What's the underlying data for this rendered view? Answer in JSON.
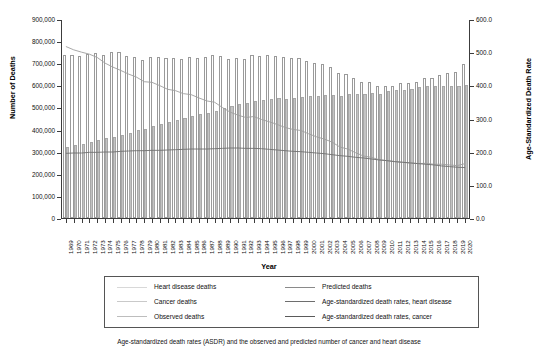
{
  "figure": {
    "caption": "Age-standardized death rates (ASDR) and the observed and predicted number of cancer and heart disease"
  },
  "axes": {
    "y_left": {
      "title": "Number of Deaths",
      "ticks": [
        "0",
        "100,000",
        "200,000",
        "300,000",
        "400,000",
        "500,000",
        "600,000",
        "700,000",
        "800,000",
        "900,000"
      ],
      "min": 0,
      "max": 900000
    },
    "y_right": {
      "title": "Age-Standardized Death Rate",
      "ticks": [
        "0.0",
        "100.0",
        "200.0",
        "300.0",
        "400.0",
        "500.0",
        "600.0"
      ],
      "min": 0,
      "max": 600
    },
    "x": {
      "title": "Year"
    }
  },
  "legend": {
    "items": [
      {
        "label": "Heart disease deaths",
        "swatch": "bar-outline-light",
        "color": "#d8d8d8"
      },
      {
        "label": "Cancer deaths",
        "swatch": "bar-fill-gray",
        "color": "#c9c9c9"
      },
      {
        "label": "Observed deaths",
        "swatch": "line-light-gray",
        "color": "#bdbdbd"
      },
      {
        "label": "Predicted deaths",
        "swatch": "line-mid-gray",
        "color": "#8a8a8a"
      },
      {
        "label": "Age-standardized death rates, heart disease",
        "swatch": "line-dark-gray",
        "color": "#6e6e6e"
      },
      {
        "label": "Age-standardized death rates, cancer",
        "swatch": "line-darkest-gray",
        "color": "#5a5a5a"
      }
    ]
  },
  "colors": {
    "heart_bar_fill": "#ffffff",
    "heart_bar_edge": "#9a9a9a",
    "cancer_bar_fill": "#c3c3c3",
    "cancer_bar_edge": "#a8a8a8",
    "asdr_heart_line": "#9e9e9e",
    "asdr_cancer_line": "#707070",
    "axis": "#3c3c3c"
  },
  "chart_data": {
    "type": "bar",
    "title": "",
    "subtitle": "",
    "xlabel": "Year",
    "ylabel": "Number of Deaths",
    "y2label": "Age-Standardized Death Rate",
    "ylim": [
      0,
      900000
    ],
    "y2lim": [
      0,
      600
    ],
    "grid": false,
    "legend_position": "bottom",
    "categories": [
      "1969",
      "1970",
      "1971",
      "1972",
      "1973",
      "1974",
      "1975",
      "1976",
      "1977",
      "1978",
      "1979",
      "1980",
      "1981",
      "1982",
      "1983",
      "1984",
      "1985",
      "1986",
      "1987",
      "1988",
      "1989",
      "1990",
      "1991",
      "1992",
      "1993",
      "1994",
      "1995",
      "1996",
      "1997",
      "1998",
      "1999",
      "2000",
      "2001",
      "2002",
      "2003",
      "2004",
      "2005",
      "2006",
      "2007",
      "2008",
      "2009",
      "2010",
      "2011",
      "2012",
      "2013",
      "2014",
      "2015",
      "2016",
      "2017",
      "2018",
      "2019",
      "2020"
    ],
    "series": [
      {
        "name": "Heart disease deaths",
        "axis": "left",
        "type": "bar",
        "values": [
          735000,
          735000,
          731000,
          744000,
          746000,
          739000,
          751000,
          752000,
          733000,
          729000,
          714000,
          730000,
          726000,
          722000,
          723000,
          718000,
          727000,
          722000,
          726000,
          738000,
          733000,
          720000,
          725000,
          718000,
          739000,
          733000,
          738000,
          733000,
          727000,
          725000,
          725000,
          710000,
          700000,
          696000,
          685000,
          654000,
          652000,
          631000,
          616000,
          617000,
          599000,
          597000,
          597000,
          611000,
          611000,
          614000,
          634000,
          635000,
          647000,
          656000,
          660000,
          697000
        ]
      },
      {
        "name": "Cancer deaths",
        "axis": "left",
        "type": "bar",
        "values": [
          323000,
          330000,
          335000,
          346000,
          351000,
          360000,
          366000,
          377000,
          386000,
          397000,
          404000,
          417000,
          425000,
          434000,
          444000,
          453000,
          462000,
          469000,
          477000,
          485000,
          496000,
          505000,
          514000,
          521000,
          530000,
          534000,
          538000,
          544000,
          539000,
          541000,
          549000,
          553000,
          554000,
          557000,
          556000,
          554000,
          559000,
          560000,
          562000,
          566000,
          562000,
          574000,
          577000,
          580000,
          585000,
          591000,
          595000,
          598000,
          599000,
          599000,
          599000,
          602000
        ]
      },
      {
        "name": "Age-standardized death rates, heart disease",
        "axis": "right",
        "type": "line",
        "values": [
          520,
          510,
          503,
          497,
          487,
          470,
          458,
          448,
          437,
          428,
          414,
          412,
          402,
          391,
          387,
          378,
          375,
          365,
          356,
          352,
          336,
          322,
          313,
          306,
          309,
          300,
          293,
          285,
          276,
          270,
          267,
          257,
          248,
          241,
          232,
          217,
          211,
          200,
          190,
          186,
          179,
          176,
          173,
          171,
          169,
          167,
          168,
          165,
          165,
          163,
          161,
          167
        ]
      },
      {
        "name": "Age-standardized death rates, cancer",
        "axis": "right",
        "type": "line",
        "values": [
          198,
          199,
          199,
          201,
          201,
          202,
          202,
          204,
          205,
          206,
          206,
          207,
          207,
          208,
          209,
          210,
          211,
          211,
          211,
          212,
          213,
          214,
          214,
          213,
          213,
          212,
          210,
          208,
          206,
          204,
          203,
          201,
          199,
          197,
          194,
          191,
          189,
          186,
          184,
          181,
          178,
          176,
          173,
          171,
          169,
          167,
          165,
          163,
          160,
          158,
          156,
          155
        ]
      }
    ]
  }
}
